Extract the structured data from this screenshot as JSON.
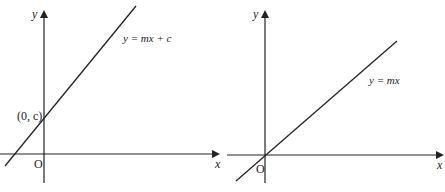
{
  "diagrams": [
    {
      "name": "graph-with-intercept",
      "x_axis_label": "x",
      "y_axis_label": "y",
      "origin_label": "O",
      "line_label": "y = mx + c",
      "intercept_label": "(0, c)"
    },
    {
      "name": "graph-through-origin",
      "x_axis_label": "x",
      "y_axis_label": "y",
      "origin_label": "O",
      "line_label": "y = mx"
    }
  ],
  "colors": {
    "line": "#222222",
    "background": "#ffffff"
  }
}
